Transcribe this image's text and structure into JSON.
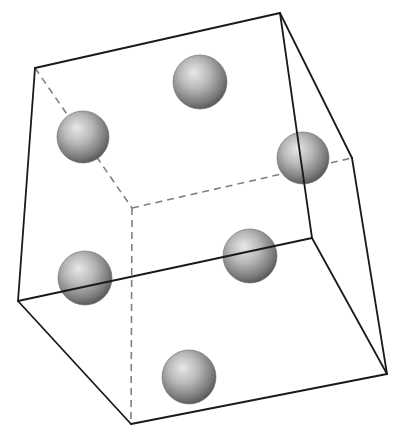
{
  "diagram": {
    "type": "cube-with-spheres",
    "colors": {
      "background": "#ffffff",
      "edge_solid": "#1a1a1a",
      "edge_hidden": "#808080",
      "sphere_light": "#e6e6e6",
      "sphere_mid": "#a8a8a8",
      "sphere_dark": "#5a5a5a"
    },
    "vertices": {
      "A": [
        35,
        68
      ],
      "B": [
        280,
        13
      ],
      "C": [
        352,
        158
      ],
      "D": [
        132,
        208
      ],
      "E": [
        18,
        301
      ],
      "F": [
        312,
        238
      ],
      "G": [
        387,
        374
      ],
      "H": [
        131,
        424
      ]
    },
    "edges_solid": [
      [
        "A",
        "B"
      ],
      [
        "A",
        "E"
      ],
      [
        "B",
        "F"
      ],
      [
        "B",
        "C"
      ],
      [
        "C",
        "G"
      ],
      [
        "E",
        "F"
      ],
      [
        "F",
        "G"
      ],
      [
        "E",
        "H"
      ],
      [
        "H",
        "G"
      ]
    ],
    "edges_hidden": [
      [
        "A",
        "D"
      ],
      [
        "D",
        "C"
      ],
      [
        "D",
        "H"
      ]
    ],
    "spheres": [
      {
        "name": "top-face",
        "cx": 200,
        "cy": 82,
        "r": 27
      },
      {
        "name": "left-face",
        "cx": 83,
        "cy": 137,
        "r": 26
      },
      {
        "name": "right-face",
        "cx": 303,
        "cy": 158,
        "r": 26
      },
      {
        "name": "front-face",
        "cx": 85,
        "cy": 278,
        "r": 27
      },
      {
        "name": "back-face",
        "cx": 250,
        "cy": 256,
        "r": 27
      },
      {
        "name": "bottom-face",
        "cx": 189,
        "cy": 377,
        "r": 27
      }
    ]
  }
}
